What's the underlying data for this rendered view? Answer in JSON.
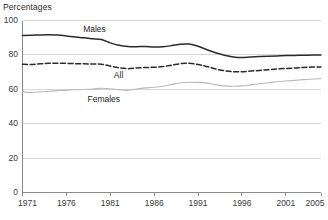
{
  "chart_data": {
    "type": "line",
    "title": "",
    "ylabel": "Percentages",
    "xlabel": "",
    "ylim": [
      0,
      100
    ],
    "xlim": [
      1971,
      2005
    ],
    "yticks": [
      0,
      20,
      40,
      60,
      80,
      100
    ],
    "ytick_labels": [
      "0",
      "20",
      "40",
      "60",
      "80",
      "100"
    ],
    "xticks": [
      1971,
      1976,
      1981,
      1986,
      1991,
      1996,
      2001,
      2005
    ],
    "xtick_labels": [
      "1971",
      "1976",
      "1981",
      "1986",
      "1991",
      "1996",
      "2001",
      "2005"
    ],
    "grid": "horizontal",
    "legend_position": "inline-annotations",
    "x": [
      1971,
      1972,
      1973,
      1974,
      1975,
      1976,
      1977,
      1978,
      1979,
      1980,
      1981,
      1982,
      1983,
      1984,
      1985,
      1986,
      1987,
      1988,
      1989,
      1990,
      1991,
      1992,
      1993,
      1994,
      1995,
      1996,
      1997,
      1998,
      1999,
      2000,
      2001,
      2002,
      2003,
      2004,
      2005
    ],
    "series": [
      {
        "name": "Males",
        "style": "solid",
        "color": "#2b2b2b",
        "values": [
          91.3,
          91.4,
          91.6,
          91.7,
          91.5,
          91.0,
          90.4,
          89.9,
          89.4,
          88.9,
          87.0,
          85.6,
          84.9,
          84.8,
          84.9,
          84.6,
          84.8,
          85.4,
          86.2,
          86.3,
          85.0,
          83.0,
          81.2,
          79.8,
          78.8,
          78.5,
          78.8,
          79.0,
          79.2,
          79.4,
          79.6,
          79.7,
          79.8,
          79.9,
          79.9
        ]
      },
      {
        "name": "All",
        "style": "dashed",
        "color": "#2b2b2b",
        "values": [
          74.6,
          74.4,
          74.8,
          75.1,
          75.2,
          75.1,
          74.9,
          74.8,
          74.7,
          74.6,
          73.5,
          72.5,
          72.0,
          72.4,
          72.7,
          72.8,
          73.2,
          74.0,
          74.9,
          75.1,
          74.4,
          73.2,
          71.8,
          70.8,
          70.2,
          70.2,
          70.6,
          71.0,
          71.4,
          71.8,
          72.1,
          72.4,
          72.7,
          72.9,
          73.0
        ]
      },
      {
        "name": "Females",
        "style": "solid",
        "color": "#b8b8b8",
        "values": [
          58.6,
          58.2,
          58.5,
          58.9,
          59.2,
          59.5,
          59.7,
          59.9,
          60.2,
          60.6,
          60.3,
          59.7,
          59.4,
          60.2,
          60.8,
          61.2,
          61.8,
          62.8,
          63.8,
          64.1,
          64.0,
          63.6,
          62.7,
          62.0,
          61.8,
          62.0,
          62.6,
          63.2,
          63.8,
          64.4,
          64.8,
          65.2,
          65.6,
          66.0,
          66.2
        ]
      }
    ],
    "annotations": [
      {
        "text": "Males",
        "x": 1979.5,
        "y": 94.5
      },
      {
        "text": "All",
        "x": 1983.0,
        "y": 67.5
      },
      {
        "text": "Females",
        "x": 1980.0,
        "y": 53.5
      }
    ]
  },
  "colors": {
    "background": "#ffffff",
    "grid": "#d6d6d6",
    "axis": "#8a8a8a",
    "text": "#2b2b2b",
    "males": "#2b2b2b",
    "all": "#2b2b2b",
    "females": "#b8b8b8"
  }
}
